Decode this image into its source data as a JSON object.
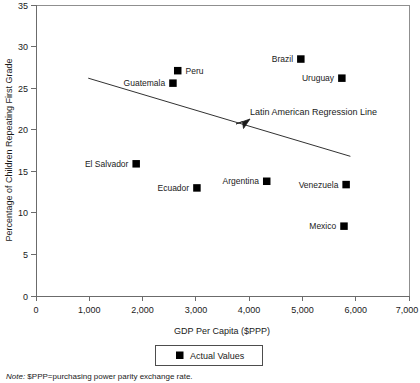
{
  "chart_data": {
    "type": "scatter",
    "title": "",
    "xlabel": "GDP Per Capita ($PPP)",
    "ylabel": "Percentage of Children Repeating First Grade",
    "xlim": [
      0,
      7000
    ],
    "ylim": [
      0,
      35
    ],
    "xticks": [
      "0",
      "1,000",
      "2,000",
      "3,000",
      "4,000",
      "5,000",
      "6,000",
      "7,000"
    ],
    "xtick_values": [
      0,
      1000,
      2000,
      3000,
      4000,
      5000,
      6000,
      7000
    ],
    "yticks": [
      "0",
      "5",
      "10",
      "15",
      "20",
      "25",
      "30",
      "35"
    ],
    "ytick_values": [
      0,
      5,
      10,
      15,
      20,
      25,
      30,
      35
    ],
    "grid": false,
    "legend_position": "below-axis-center",
    "series": [
      {
        "name": "Actual Values",
        "marker": "filled-square",
        "color": "#000000",
        "points": [
          {
            "label": "Peru",
            "x": 2660,
            "y": 27.1,
            "label_side": "right"
          },
          {
            "label": "Guatemala",
            "x": 2570,
            "y": 25.6,
            "label_side": "left"
          },
          {
            "label": "Brazil",
            "x": 4970,
            "y": 28.5,
            "label_side": "left"
          },
          {
            "label": "Uruguay",
            "x": 5740,
            "y": 26.2,
            "label_side": "left"
          },
          {
            "label": "El Salvador",
            "x": 1880,
            "y": 15.9,
            "label_side": "left"
          },
          {
            "label": "Ecuador",
            "x": 3020,
            "y": 13.0,
            "label_side": "left"
          },
          {
            "label": "Argentina",
            "x": 4330,
            "y": 13.8,
            "label_side": "left"
          },
          {
            "label": "Venezuela",
            "x": 5820,
            "y": 13.4,
            "label_side": "left"
          },
          {
            "label": "Mexico",
            "x": 5780,
            "y": 8.4,
            "label_side": "left"
          }
        ]
      }
    ],
    "trendline": {
      "name": "Latin American Regression Line",
      "x_start": 980,
      "y_start": 26.2,
      "x_end": 5900,
      "y_end": 16.8,
      "annotation": "Latin American Regression Line"
    },
    "legend": [
      {
        "label": "Actual Values",
        "marker": "filled-square",
        "color": "#000000"
      }
    ],
    "note": {
      "italic_prefix": "Note:",
      "text": " $PPP=purchasing power parity exchange rate."
    }
  }
}
